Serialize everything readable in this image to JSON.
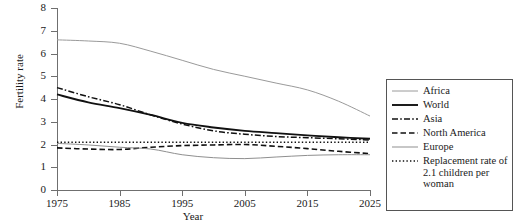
{
  "chart_data": {
    "type": "line",
    "title": "",
    "xlabel": "Year",
    "ylabel": "Fertility rate",
    "xlim": [
      1975,
      2025
    ],
    "ylim": [
      0,
      8
    ],
    "xticks": [
      1975,
      1985,
      1995,
      2005,
      2015,
      2025
    ],
    "yticks": [
      0,
      1,
      2,
      3,
      4,
      5,
      6,
      7,
      8
    ],
    "grid": false,
    "legend_position": "right-outside",
    "x": [
      1975,
      1980,
      1985,
      1990,
      1995,
      2000,
      2005,
      2010,
      2015,
      2020,
      2025
    ],
    "series": [
      {
        "name": "Africa",
        "style": "solid-thin",
        "color": "#9a9a9a",
        "values": [
          6.6,
          6.55,
          6.45,
          6.1,
          5.7,
          5.3,
          5.0,
          4.7,
          4.4,
          3.9,
          3.25
        ]
      },
      {
        "name": "World",
        "style": "solid-thick",
        "color": "#111111",
        "values": [
          4.2,
          3.85,
          3.6,
          3.3,
          2.95,
          2.75,
          2.6,
          2.5,
          2.4,
          2.32,
          2.25
        ]
      },
      {
        "name": "Asia",
        "style": "dash-dot",
        "color": "#111111",
        "values": [
          4.5,
          4.1,
          3.75,
          3.3,
          2.9,
          2.6,
          2.45,
          2.35,
          2.3,
          2.25,
          2.2
        ]
      },
      {
        "name": "North America",
        "style": "dashed",
        "color": "#111111",
        "values": [
          1.85,
          1.8,
          1.78,
          1.88,
          1.95,
          1.98,
          2.0,
          1.92,
          1.82,
          1.7,
          1.6
        ]
      },
      {
        "name": "Europe",
        "style": "solid-thin",
        "color": "#8f8f8f",
        "values": [
          2.05,
          1.98,
          1.88,
          1.8,
          1.55,
          1.42,
          1.38,
          1.45,
          1.52,
          1.55,
          1.55
        ]
      },
      {
        "name": "Replacement rate of 2.1 children per woman",
        "style": "dotted",
        "color": "#111111",
        "values": [
          2.1,
          2.1,
          2.1,
          2.1,
          2.1,
          2.1,
          2.1,
          2.1,
          2.1,
          2.1,
          2.1
        ]
      }
    ]
  },
  "axis": {
    "y_label": "Fertility rate",
    "x_label": "Year",
    "y_ticks": [
      "0",
      "1",
      "2",
      "3",
      "4",
      "5",
      "6",
      "7",
      "8"
    ],
    "x_ticks": [
      "1975",
      "1985",
      "1995",
      "2005",
      "2015",
      "2025"
    ]
  },
  "legend": {
    "entries": [
      {
        "label": "Africa"
      },
      {
        "label": "World"
      },
      {
        "label": "Asia"
      },
      {
        "label": "North America"
      },
      {
        "label": "Europe"
      },
      {
        "label": "Replacement rate of 2.1 children per woman"
      }
    ]
  }
}
